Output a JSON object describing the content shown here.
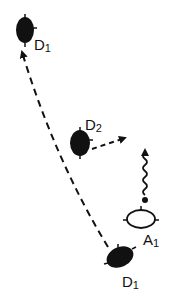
{
  "colors": {
    "ink": "#111111",
    "background": "#ffffff"
  },
  "nodes": [
    {
      "id": "d1-top",
      "label": "D",
      "subscript": "1",
      "type": "filled-ellipse",
      "cx": 25,
      "cy": 30
    },
    {
      "id": "d2",
      "label": "D",
      "subscript": "2",
      "type": "filled-ellipse",
      "cx": 80,
      "cy": 143
    },
    {
      "id": "a1",
      "label": "A",
      "subscript": "1",
      "type": "open-ellipse",
      "cx": 141,
      "cy": 219
    },
    {
      "id": "d1-bottom",
      "label": "D",
      "subscript": "1",
      "type": "filled-ellipse",
      "cx": 120,
      "cy": 257
    }
  ],
  "edges": [
    {
      "id": "migration-d1",
      "style": "dashed-arrow",
      "from": "d1-bottom",
      "to": "d1-top"
    },
    {
      "id": "d2-out",
      "style": "dashed-arrow",
      "from": "d2",
      "to": "right"
    },
    {
      "id": "a1-signal",
      "style": "wavy-arrow",
      "from": "a1",
      "to": "up"
    }
  ]
}
